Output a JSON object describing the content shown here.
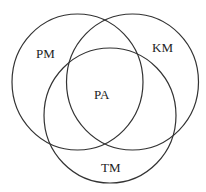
{
  "diagram": {
    "type": "venn",
    "sets": [
      {
        "id": "pm",
        "label": "PM"
      },
      {
        "id": "km",
        "label": "KM"
      },
      {
        "id": "tm",
        "label": "TM"
      }
    ],
    "intersection_label": "PA"
  }
}
